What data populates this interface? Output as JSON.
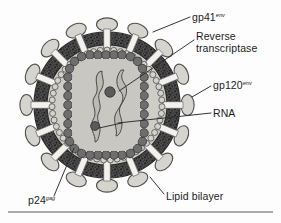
{
  "figure": {
    "background_color": "#fdfdfd"
  },
  "labels": {
    "gp41": {
      "text": "gp41",
      "superscript": "env",
      "name": "gp41-env"
    },
    "reverse_transcriptase": {
      "line1": "Reverse",
      "line2": "transcriptase",
      "name": "reverse-transcriptase"
    },
    "gp120": {
      "text": "gp120",
      "superscript": "env",
      "name": "gp120-env"
    },
    "rna": {
      "text": "RNA",
      "name": "rna"
    },
    "lipid_bilayer": {
      "text": "Lipid bilayer",
      "name": "lipid-bilayer"
    },
    "p24": {
      "text": "p24",
      "superscript": "gag",
      "name": "p24-gag"
    }
  },
  "colors": {
    "envelope_dark": "#4a4a4a",
    "envelope_stipple": "#2b2b2b",
    "matrix_bead_fill": "#d4d2cd",
    "matrix_bead_stroke": "#5b5b5b",
    "interior_fill": "#cfcdc8",
    "capsid_bead_fill": "#6e6e6e",
    "capsid_bead_stroke": "#3a3a3a",
    "core_fill": "#c9c7c2",
    "rna_strand": "#b9b7b2",
    "rna_stroke": "#4a4a4a",
    "rt_dot": "#5a5a5a",
    "spike_head_fill": "#d6d4cf",
    "spike_head_stroke": "#4f4f4f",
    "spike_stalk": "#f2f1ee",
    "leader_line": "#2a2a2a",
    "rule_line": "#5a5a5a",
    "text": "#1c1c1c"
  },
  "geometry": {
    "center": {
      "x": 107,
      "y": 105
    },
    "envelope_outer_radius": 73,
    "envelope_inner_radius": 60,
    "matrix_ring_radius": 55,
    "interior_radius": 52,
    "capsid_rect": {
      "x": 68,
      "y": 55,
      "width": 76,
      "height": 100,
      "corner_radius": 22
    },
    "spike_count": 16
  },
  "structures": [
    {
      "name": "envelope-spikes",
      "description": "gp120 envelope glycoprotein knobs on gp41 transmembrane stalks"
    },
    {
      "name": "lipid-bilayer",
      "description": "dark stippled host-derived lipid envelope band"
    },
    {
      "name": "matrix-layer",
      "description": "ring of light beads (p17 matrix) lining the envelope"
    },
    {
      "name": "capsid",
      "description": "rounded rectangular p24 capsid core made of dark beads"
    },
    {
      "name": "rna-genome",
      "description": "two wavy single-stranded RNA molecules inside the capsid"
    },
    {
      "name": "reverse-transcriptase",
      "description": "dark enzyme dots bound to the RNA strands"
    }
  ],
  "footer_rule": {
    "present": true,
    "y": 212
  }
}
